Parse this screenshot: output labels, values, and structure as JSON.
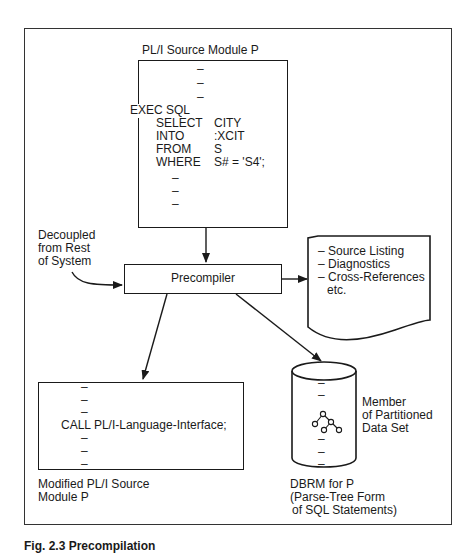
{
  "source_module": {
    "title": "PL/I Source Module P",
    "lines_before": [
      "–",
      "–",
      "–"
    ],
    "exec_line": "EXEC SQL",
    "sql": [
      {
        "kw": "SELECT",
        "arg": "CITY"
      },
      {
        "kw": "INTO",
        "arg": ":XCIT"
      },
      {
        "kw": "FROM",
        "arg": "S"
      },
      {
        "kw": "WHERE",
        "arg": "S# = 'S4';"
      }
    ],
    "lines_after": [
      "–",
      "–",
      "–"
    ]
  },
  "decoupled_note": [
    "Decoupled",
    "from Rest",
    "of System"
  ],
  "precompiler": {
    "label": "Precompiler"
  },
  "listing_doc": {
    "items": [
      "– Source Listing",
      "– Diagnostics",
      "– Cross-References"
    ],
    "trailer": "etc."
  },
  "modified_module": {
    "lines_before": [
      "–",
      "–",
      "–"
    ],
    "call_line": "CALL PL/I-Language-Interface;",
    "lines_after": [
      "–",
      "–",
      "–"
    ],
    "caption": [
      "Modified PL/I Source",
      "Module P"
    ]
  },
  "dbrm": {
    "member_note": [
      "Member",
      "of Partitioned",
      "Data Set"
    ],
    "caption": [
      "DBRM for P",
      "(Parse-Tree Form",
      "of SQL Statements)"
    ],
    "dashes_top": [
      "–",
      "–"
    ],
    "dashes_bottom": [
      "–",
      "–",
      "–"
    ]
  },
  "figure_caption": "Fig. 2.3 Precompilation"
}
